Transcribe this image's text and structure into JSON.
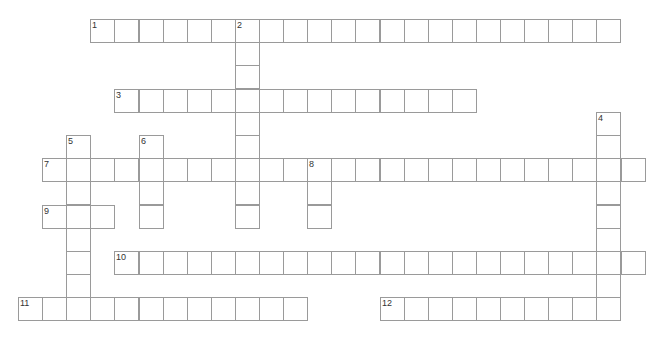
{
  "puzzle": {
    "type": "crossword",
    "grid": {
      "origin_x": 18,
      "origin_y": 19,
      "cell_width": 24.1,
      "cell_height": 23.2,
      "columns": 26,
      "rows": 13,
      "border_color": "#9a9a9a",
      "cell_background": "#ffffff",
      "number_color": "#333333"
    },
    "entries": [
      {
        "number": "1",
        "direction": "across",
        "col": 3,
        "row": 0,
        "length": 22,
        "answer": ""
      },
      {
        "number": "2",
        "direction": "down",
        "col": 9,
        "row": 0,
        "length": 9,
        "answer": ""
      },
      {
        "number": "3",
        "direction": "across",
        "col": 4,
        "row": 3,
        "length": 15,
        "answer": ""
      },
      {
        "number": "4",
        "direction": "down",
        "col": 24,
        "row": 4,
        "length": 9,
        "answer": ""
      },
      {
        "number": "5",
        "direction": "down",
        "col": 2,
        "row": 5,
        "length": 8,
        "answer": ""
      },
      {
        "number": "6",
        "direction": "down",
        "col": 5,
        "row": 5,
        "length": 4,
        "answer": ""
      },
      {
        "number": "7",
        "direction": "across",
        "col": 1,
        "row": 6,
        "length": 25,
        "answer": ""
      },
      {
        "number": "8",
        "direction": "down",
        "col": 12,
        "row": 6,
        "length": 3,
        "answer": ""
      },
      {
        "number": "9",
        "direction": "across",
        "col": 1,
        "row": 8,
        "length": 3,
        "answer": ""
      },
      {
        "number": "10",
        "direction": "across",
        "col": 4,
        "row": 10,
        "length": 22,
        "answer": ""
      },
      {
        "number": "11",
        "direction": "across",
        "col": 0,
        "row": 12,
        "length": 12,
        "answer": ""
      },
      {
        "number": "12",
        "direction": "across",
        "col": 15,
        "row": 12,
        "length": 10,
        "answer": ""
      }
    ]
  }
}
